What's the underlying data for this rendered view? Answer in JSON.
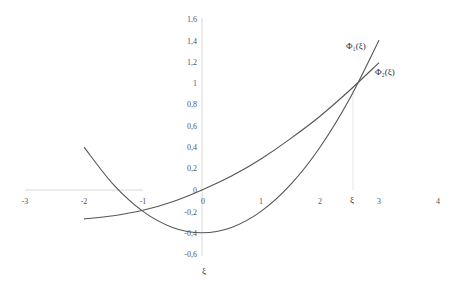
{
  "chart_data": {
    "type": "line",
    "title": "",
    "xlabel": "ξ",
    "ylabel": "",
    "xlim": [
      -3,
      4
    ],
    "ylim": [
      -0.6,
      1.6
    ],
    "grid": false,
    "x_ticks": [
      "-3",
      "-2",
      "-1",
      "0",
      "1",
      "2",
      "3",
      "4"
    ],
    "y_ticks": [
      "1,6",
      "1,4",
      "1,2",
      "1",
      "0,8",
      "0,6",
      "0,4",
      "0,2",
      "0",
      "-0,2",
      "-0,4",
      "-0,6"
    ],
    "series": [
      {
        "name": "Φ₁(ξ)",
        "x": [
          -2,
          -1.5,
          -1,
          -0.5,
          0,
          0.5,
          1,
          1.5,
          2,
          2.5,
          3
        ],
        "y": [
          0.4,
          0.05,
          -0.2,
          -0.35,
          -0.4,
          -0.35,
          -0.2,
          0.05,
          0.4,
          0.85,
          1.4
        ]
      },
      {
        "name": "Φ₂(ξ)",
        "x": [
          -2,
          -1.5,
          -1,
          -0.5,
          0,
          0.5,
          1,
          1.5,
          2,
          2.5,
          3
        ],
        "y": [
          -0.27,
          -0.24,
          -0.19,
          -0.11,
          0.0,
          0.13,
          0.29,
          0.48,
          0.69,
          0.93,
          1.19
        ]
      }
    ],
    "annotations": [
      {
        "text": "Φ₁(ξ)",
        "near": "series 1 upper end"
      },
      {
        "text": "Φ₂(ξ)",
        "near": "series 2 upper end"
      },
      {
        "text": "ξ",
        "x": 2.56,
        "note": "intersection abscissa marker on x-axis"
      }
    ],
    "intersection": {
      "x": 2.56,
      "y": 0.93
    }
  },
  "labels": {
    "phi1": "Φ₁(ξ)",
    "phi2": "Φ₂(ξ)",
    "xi_marker": "ξ",
    "x_axis_title": "ξ"
  }
}
